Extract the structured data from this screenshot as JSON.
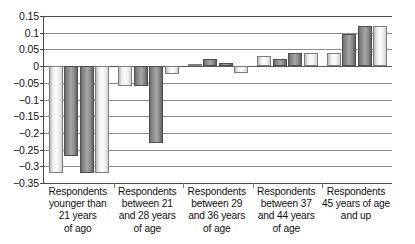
{
  "chart_data": {
    "type": "bar",
    "title": "",
    "subtitle": "",
    "xlabel": "",
    "ylabel": "",
    "ylim": [
      -0.35,
      0.15
    ],
    "grid": true,
    "grid_axis": "y",
    "legend": false,
    "legend_position": "none",
    "orientation": "vertical",
    "grouping": "grouped",
    "bar_count_per_group": 4,
    "zero_line": 0,
    "ytick_labels": [
      "0.15",
      "0.1",
      "0.05",
      "0",
      "-0.05",
      "-0.1",
      "-0.15",
      "-0.2",
      "-0.25",
      "-0.3",
      "-0.35"
    ],
    "ytick_values": [
      0.15,
      0.1,
      0.05,
      0,
      -0.05,
      -0.1,
      -0.15,
      -0.2,
      -0.25,
      -0.3,
      -0.35
    ],
    "categories": [
      "Respondents younger than 21 years of ago",
      "Respondents between 21 and 28 years of age",
      "Respondents between 29 and 36 years of age",
      "Respondents between 37 and 44 years of age",
      "Respondents 45 years of age and up"
    ],
    "category_label_lines": [
      [
        "Respondents",
        "younger than",
        "21 years",
        "of ago"
      ],
      [
        "Respondents",
        "between 21",
        "and 28 years",
        "of age"
      ],
      [
        "Respondents",
        "between 29",
        "and 36 years",
        "of age"
      ],
      [
        "Respondents",
        "between 37",
        "and 44 years",
        "of age"
      ],
      [
        "Respondents",
        "45 years of age",
        "and up"
      ]
    ],
    "series": [
      {
        "name": "Series 1",
        "shade": "light",
        "values": [
          -0.32,
          -0.06,
          0.005,
          0.03,
          0.04
        ]
      },
      {
        "name": "Series 2",
        "shade": "dark",
        "values": [
          -0.27,
          -0.06,
          0.02,
          0.02,
          0.095
        ]
      },
      {
        "name": "Series 3",
        "shade": "dark",
        "values": [
          -0.32,
          -0.23,
          0.01,
          0.04,
          0.12
        ]
      },
      {
        "name": "Series 4",
        "shade": "light",
        "values": [
          -0.32,
          -0.025,
          -0.02,
          0.04,
          0.12
        ]
      }
    ],
    "colors": {
      "light_bar": "#f2f2f2",
      "dark_bar": "#8d8d8d",
      "bar_outline": "#6e6e6e",
      "gridline": "#8d8d8d",
      "axis": "#4a4a4a",
      "text": "#111111",
      "background": "#ffffff"
    }
  }
}
